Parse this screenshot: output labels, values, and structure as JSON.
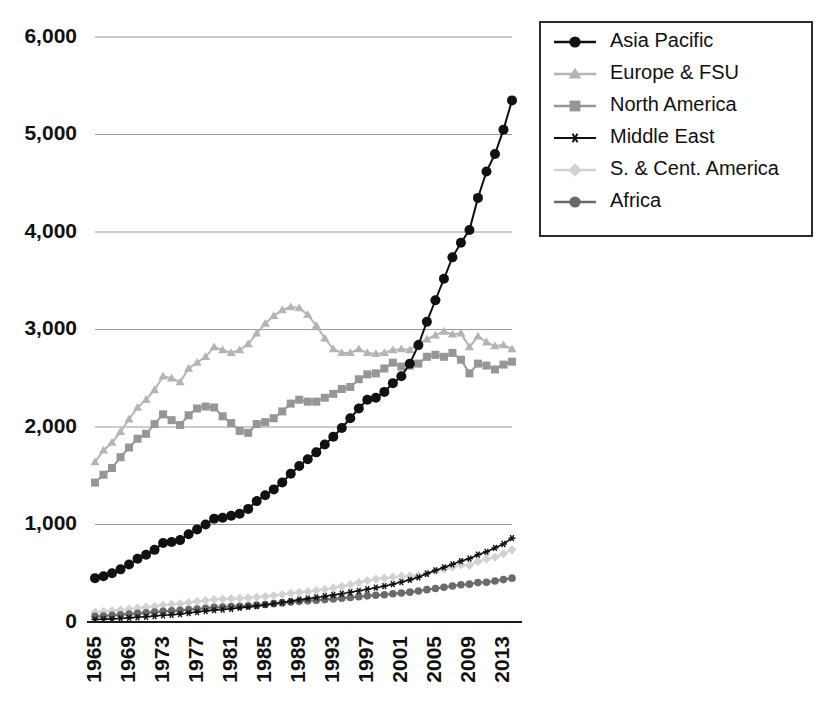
{
  "chart_data": {
    "type": "line",
    "title": "",
    "subtitle": "",
    "xlabel": "",
    "ylabel": "",
    "xlim": [
      1965,
      2014
    ],
    "ylim": [
      0,
      6000
    ],
    "grid": true,
    "legend_position": "top-right",
    "y_ticks": [
      0,
      1000,
      2000,
      3000,
      4000,
      5000,
      6000
    ],
    "y_tick_labels": [
      "0",
      "1,000",
      "2,000",
      "3,000",
      "4,000",
      "5,000",
      "6,000"
    ],
    "x_ticks": [
      1965,
      1969,
      1973,
      1977,
      1981,
      1985,
      1989,
      1993,
      1997,
      2001,
      2005,
      2009,
      2013
    ],
    "x_tick_labels": [
      "1965",
      "1969",
      "1973",
      "1977",
      "1981",
      "1985",
      "1989",
      "1993",
      "1997",
      "2001",
      "2005",
      "2009",
      "2013"
    ],
    "x": [
      1965,
      1966,
      1967,
      1968,
      1969,
      1970,
      1971,
      1972,
      1973,
      1974,
      1975,
      1976,
      1977,
      1978,
      1979,
      1980,
      1981,
      1982,
      1983,
      1984,
      1985,
      1986,
      1987,
      1988,
      1989,
      1990,
      1991,
      1992,
      1993,
      1994,
      1995,
      1996,
      1997,
      1998,
      1999,
      2000,
      2001,
      2002,
      2003,
      2004,
      2005,
      2006,
      2007,
      2008,
      2009,
      2010,
      2011,
      2012,
      2013,
      2014
    ],
    "series": [
      {
        "name": "Asia Pacific",
        "color": "#111111",
        "marker": "circle",
        "values": [
          450,
          470,
          500,
          540,
          590,
          650,
          690,
          740,
          810,
          820,
          840,
          900,
          950,
          1000,
          1060,
          1070,
          1090,
          1110,
          1160,
          1240,
          1300,
          1360,
          1430,
          1520,
          1600,
          1670,
          1740,
          1820,
          1900,
          1990,
          2090,
          2190,
          2280,
          2300,
          2360,
          2450,
          2520,
          2650,
          2840,
          3080,
          3300,
          3520,
          3740,
          3890,
          4020,
          4350,
          4620,
          4800,
          5050,
          5350
        ]
      },
      {
        "name": "Europe & FSU",
        "color": "#b4b4b4",
        "marker": "triangle",
        "values": [
          1640,
          1760,
          1840,
          1950,
          2080,
          2200,
          2280,
          2380,
          2520,
          2500,
          2460,
          2600,
          2660,
          2720,
          2820,
          2790,
          2760,
          2790,
          2850,
          2960,
          3060,
          3140,
          3200,
          3230,
          3220,
          3150,
          3040,
          2910,
          2800,
          2760,
          2760,
          2800,
          2760,
          2750,
          2760,
          2790,
          2800,
          2790,
          2860,
          2900,
          2940,
          2980,
          2950,
          2960,
          2820,
          2930,
          2870,
          2830,
          2840,
          2800
        ]
      },
      {
        "name": "North America",
        "color": "#969696",
        "marker": "square",
        "values": [
          1430,
          1510,
          1580,
          1690,
          1790,
          1880,
          1930,
          2030,
          2130,
          2070,
          2020,
          2120,
          2190,
          2210,
          2200,
          2110,
          2040,
          1960,
          1940,
          2030,
          2050,
          2090,
          2160,
          2240,
          2280,
          2260,
          2260,
          2300,
          2340,
          2390,
          2410,
          2490,
          2540,
          2550,
          2600,
          2660,
          2620,
          2630,
          2650,
          2720,
          2740,
          2720,
          2760,
          2690,
          2550,
          2650,
          2630,
          2590,
          2640,
          2670
        ]
      },
      {
        "name": "Middle East",
        "color": "#111111",
        "marker": "star",
        "values": [
          25,
          28,
          32,
          36,
          42,
          48,
          54,
          61,
          69,
          74,
          82,
          92,
          102,
          112,
          122,
          128,
          136,
          146,
          155,
          164,
          175,
          188,
          200,
          214,
          228,
          240,
          252,
          264,
          278,
          290,
          305,
          320,
          336,
          352,
          368,
          388,
          410,
          432,
          458,
          495,
          530,
          560,
          592,
          625,
          650,
          690,
          720,
          760,
          800,
          860
        ]
      },
      {
        "name": "S. & Cent. America",
        "color": "#d2d2d2",
        "marker": "diamond",
        "values": [
          100,
          108,
          115,
          124,
          133,
          143,
          152,
          162,
          175,
          182,
          188,
          199,
          210,
          220,
          232,
          236,
          240,
          243,
          247,
          256,
          262,
          272,
          282,
          294,
          304,
          312,
          322,
          336,
          350,
          366,
          385,
          404,
          424,
          440,
          450,
          462,
          470,
          470,
          480,
          500,
          520,
          540,
          565,
          585,
          580,
          620,
          645,
          665,
          700,
          740
        ]
      },
      {
        "name": "Africa",
        "color": "#6a6a6a",
        "marker": "circle",
        "values": [
          58,
          62,
          68,
          74,
          81,
          88,
          95,
          102,
          110,
          114,
          119,
          127,
          134,
          141,
          150,
          154,
          158,
          162,
          167,
          173,
          180,
          188,
          196,
          204,
          212,
          218,
          224,
          230,
          236,
          243,
          251,
          260,
          268,
          274,
          280,
          290,
          298,
          306,
          318,
          332,
          344,
          356,
          370,
          382,
          388,
          404,
          408,
          420,
          435,
          450
        ]
      }
    ],
    "legend": [
      {
        "label": "Asia Pacific",
        "color": "#111111",
        "marker": "circle"
      },
      {
        "label": "Europe & FSU",
        "color": "#b4b4b4",
        "marker": "triangle"
      },
      {
        "label": "North America",
        "color": "#969696",
        "marker": "square"
      },
      {
        "label": "Middle East",
        "color": "#111111",
        "marker": "star"
      },
      {
        "label": "S. & Cent. America",
        "color": "#d2d2d2",
        "marker": "diamond"
      },
      {
        "label": "Africa",
        "color": "#6a6a6a",
        "marker": "circle"
      }
    ]
  },
  "layout": {
    "plot_left": 95,
    "plot_right": 512,
    "plot_top": 37,
    "plot_bottom": 622,
    "legend_x": 540,
    "legend_y": 22,
    "legend_w": 272,
    "legend_h": 214
  }
}
